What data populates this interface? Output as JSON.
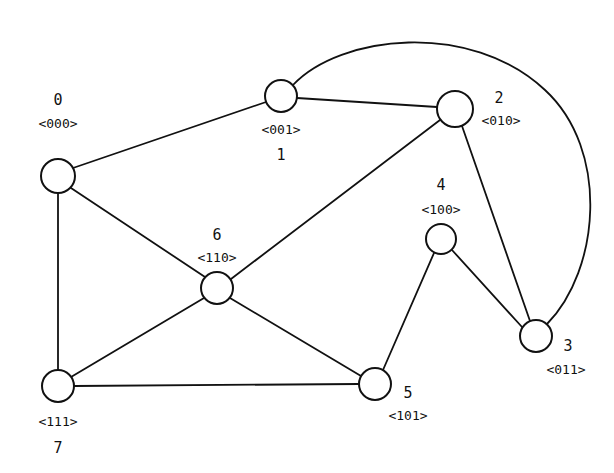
{
  "diagram": {
    "type": "graph",
    "title": "",
    "style": {
      "stroke_color": "#111111",
      "background": "#ffffff",
      "node_fill": "#ffffff"
    },
    "nodes": [
      {
        "id": "0",
        "code": "<000>",
        "x": 58,
        "y": 176,
        "r": 17,
        "id_label": {
          "x": 58,
          "y": 105
        },
        "code_label": {
          "x": 58,
          "y": 128
        }
      },
      {
        "id": "1",
        "code": "<001>",
        "x": 281,
        "y": 96,
        "r": 16,
        "code_label": {
          "x": 281,
          "y": 134
        },
        "id_label": {
          "x": 281,
          "y": 160
        }
      },
      {
        "id": "2",
        "code": "<010>",
        "x": 455,
        "y": 109,
        "r": 18,
        "id_label": {
          "x": 499,
          "y": 103
        },
        "code_label": {
          "x": 501,
          "y": 125
        }
      },
      {
        "id": "3",
        "code": "<011>",
        "x": 536,
        "y": 336,
        "r": 16,
        "id_label": {
          "x": 568,
          "y": 351
        },
        "code_label": {
          "x": 566,
          "y": 374
        }
      },
      {
        "id": "4",
        "code": "<100>",
        "x": 441,
        "y": 239,
        "r": 15,
        "id_label": {
          "x": 441,
          "y": 190
        },
        "code_label": {
          "x": 441,
          "y": 214
        }
      },
      {
        "id": "5",
        "code": "<101>",
        "x": 375,
        "y": 384,
        "r": 16,
        "id_label": {
          "x": 408,
          "y": 398
        },
        "code_label": {
          "x": 408,
          "y": 420
        }
      },
      {
        "id": "6",
        "code": "<110>",
        "x": 217,
        "y": 288,
        "r": 16,
        "id_label": {
          "x": 217,
          "y": 240
        },
        "code_label": {
          "x": 217,
          "y": 262
        }
      },
      {
        "id": "7",
        "code": "<111>",
        "x": 58,
        "y": 386,
        "r": 16,
        "code_label": {
          "x": 58,
          "y": 426
        },
        "id_label": {
          "x": 58,
          "y": 453
        }
      }
    ],
    "edges": [
      {
        "from": "0",
        "to": "1",
        "path": "M 73 168 L 266 102"
      },
      {
        "from": "0",
        "to": "6",
        "path": "M 71 188 L 205 277"
      },
      {
        "from": "0",
        "to": "7",
        "path": "M 58 193 L 58 370"
      },
      {
        "from": "1",
        "to": "2",
        "path": "M 297 98 L 437 107"
      },
      {
        "from": "1",
        "to": "3",
        "path": "M 293 85 C 340 35, 470 20, 545 90 C 610 150, 600 270, 547 324",
        "shape": "arc"
      },
      {
        "from": "2",
        "to": "6",
        "path": "M 440 120 L 231 279"
      },
      {
        "from": "2",
        "to": "3",
        "path": "M 462 126 L 530 321"
      },
      {
        "from": "4",
        "to": "3",
        "path": "M 452 250 L 522 327"
      },
      {
        "from": "4",
        "to": "5",
        "path": "M 434 253 L 383 370"
      },
      {
        "from": "6",
        "to": "5",
        "path": "M 230 298 L 361 376"
      },
      {
        "from": "6",
        "to": "7",
        "path": "M 204 298 L 71 377"
      },
      {
        "from": "7",
        "to": "5",
        "path": "M 74 386 L 359 384"
      }
    ]
  }
}
